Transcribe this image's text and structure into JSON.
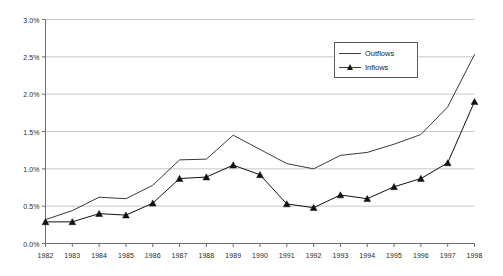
{
  "chart_data": {
    "type": "line",
    "title": "",
    "subtitle": "",
    "xlabel": "",
    "ylabel": "",
    "x": [
      1982,
      1983,
      1984,
      1985,
      1986,
      1987,
      1988,
      1989,
      1990,
      1991,
      1992,
      1993,
      1994,
      1995,
      1996,
      1997,
      1998
    ],
    "categories": [
      "1982",
      "1983",
      "1984",
      "1985",
      "1986",
      "1987",
      "1988",
      "1989",
      "1990",
      "1991",
      "1992",
      "1993",
      "1994",
      "1995",
      "1996",
      "1997",
      "1998"
    ],
    "series": [
      {
        "name": "Outflows",
        "marker": "none",
        "color": "#3a3a3a",
        "values": [
          0.32,
          0.44,
          0.62,
          0.6,
          0.78,
          1.12,
          1.13,
          1.45,
          1.26,
          1.07,
          1.0,
          1.18,
          1.22,
          1.33,
          1.46,
          1.83,
          2.53
        ]
      },
      {
        "name": "Inflows",
        "marker": "triangle",
        "color": "#111111",
        "values": [
          0.29,
          0.29,
          0.4,
          0.38,
          0.54,
          0.87,
          0.89,
          1.05,
          0.92,
          0.53,
          0.48,
          0.65,
          0.6,
          0.76,
          0.87,
          1.08,
          1.9
        ]
      }
    ],
    "ylim": [
      0.0,
      3.0
    ],
    "ytick_step": 0.5,
    "ytick_labels": [
      "0.0%",
      "0.5%",
      "1.0%",
      "1.5%",
      "2.0%",
      "2.5%",
      "3.0%"
    ],
    "ytick_values": [
      0.0,
      0.5,
      1.0,
      1.5,
      2.0,
      2.5,
      3.0
    ],
    "grid": true,
    "grid_axis": "y",
    "grid_color": "#c8c8c8",
    "axis_color": "#6e6e6e",
    "legend_position": "top-right",
    "legend_entries": [
      "Outflows",
      "Inflows"
    ],
    "background": "#ffffff"
  },
  "legend": {
    "items": [
      {
        "label": "Outflows"
      },
      {
        "label": "Inflows"
      }
    ]
  }
}
